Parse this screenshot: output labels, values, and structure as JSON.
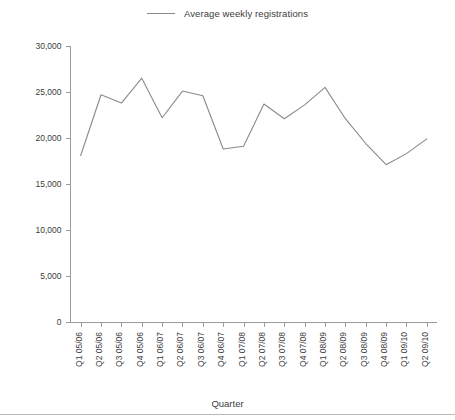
{
  "legend": {
    "position": "top-center",
    "entries": [
      {
        "label": "Average weekly registrations",
        "color": "#8a8a8a",
        "marker": "line-swatch"
      }
    ]
  },
  "axes": {
    "x_label": "Quarter",
    "y_label": "",
    "y_ticks": [
      "0",
      "5,000",
      "10,000",
      "15,000",
      "20,000",
      "25,000",
      "30,000"
    ],
    "x_ticks": [
      "Q1 05/06",
      "Q2 05/06",
      "Q3 05/06",
      "Q4 05/06",
      "Q1 06/07",
      "Q2 06/07",
      "Q3 06/07",
      "Q4 06/07",
      "Q1 07/08",
      "Q2 07/08",
      "Q3 07/08",
      "Q4 07/08",
      "Q1 08/09",
      "Q2 08/09",
      "Q3 08/09",
      "Q4 08/09",
      "Q1 09/10",
      "Q2 09/10"
    ]
  },
  "chart_data": {
    "type": "line",
    "title": "",
    "xlabel": "Quarter",
    "ylabel": "",
    "grid": false,
    "legend_position": "top-center",
    "ylim": [
      0,
      30000
    ],
    "ytick_step": 5000,
    "categories": [
      "Q1 05/06",
      "Q2 05/06",
      "Q3 05/06",
      "Q4 05/06",
      "Q1 06/07",
      "Q2 06/07",
      "Q3 06/07",
      "Q4 06/07",
      "Q1 07/08",
      "Q2 07/08",
      "Q3 07/08",
      "Q4 07/08",
      "Q1 08/09",
      "Q2 08/09",
      "Q3 08/09",
      "Q4 08/09",
      "Q1 09/10",
      "Q2 09/10"
    ],
    "series": [
      {
        "name": "Average weekly registrations",
        "color": "#8a8a8a",
        "values": [
          18100,
          24700,
          23800,
          26500,
          22200,
          25100,
          24600,
          18800,
          19100,
          23700,
          22100,
          23600,
          25500,
          22100,
          19400,
          17100,
          18300,
          19900
        ]
      }
    ]
  }
}
